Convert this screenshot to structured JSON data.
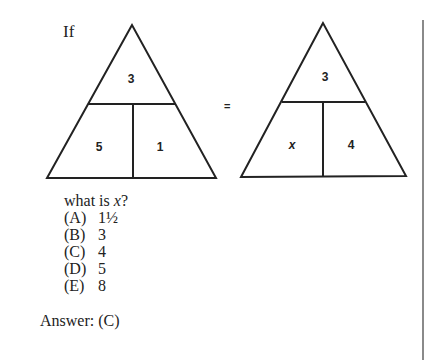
{
  "problem": {
    "lead": "If",
    "equals": "=",
    "left_triangle": {
      "top": "3",
      "bottom_left": "5",
      "bottom_right": "1"
    },
    "right_triangle": {
      "top": "3",
      "bottom_left": "x",
      "bottom_right": "4"
    },
    "question_prefix": "what is ",
    "question_var": "x",
    "question_suffix": "?",
    "options": [
      {
        "letter": "(A)",
        "value": "1½"
      },
      {
        "letter": "(B)",
        "value": "3"
      },
      {
        "letter": "(C)",
        "value": "4"
      },
      {
        "letter": "(D)",
        "value": "5"
      },
      {
        "letter": "(E)",
        "value": "8"
      }
    ],
    "answer": "Answer: (C)"
  }
}
